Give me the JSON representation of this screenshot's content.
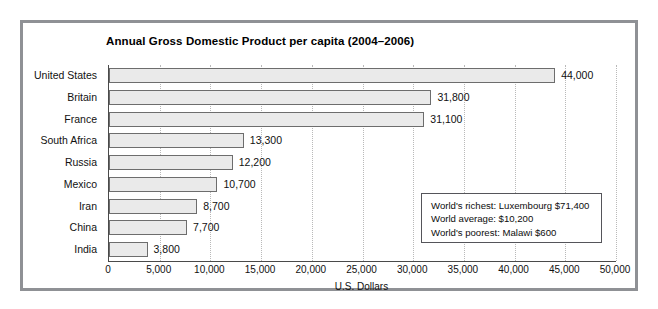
{
  "chart_data": {
    "type": "bar",
    "orientation": "horizontal",
    "title": "Annual Gross Domestic Product per capita (2004–2006)",
    "xlabel": "U.S. Dollars",
    "ylabel": "",
    "categories": [
      "United States",
      "Britain",
      "France",
      "South Africa",
      "Russia",
      "Mexico",
      "Iran",
      "China",
      "India"
    ],
    "values": [
      44000,
      31800,
      31100,
      13300,
      12200,
      10700,
      8700,
      7700,
      3800
    ],
    "value_labels": [
      "44,000",
      "31,800",
      "31,100",
      "13,300",
      "12,200",
      "10,700",
      "8,700",
      "7,700",
      "3,800"
    ],
    "xlim": [
      0,
      50000
    ],
    "xticks": [
      0,
      5000,
      10000,
      15000,
      20000,
      25000,
      30000,
      35000,
      40000,
      45000,
      50000
    ],
    "xtick_labels": [
      "0",
      "5,000",
      "10,000",
      "15,000",
      "20,000",
      "25,000",
      "30,000",
      "35,000",
      "40,000",
      "45,000",
      "50,000"
    ],
    "grid": true,
    "legend": null,
    "annotations": [
      "World's richest: Luxembourg $71,400",
      "World average: $10,200",
      "World's poorest: Malawi $600"
    ],
    "colors": {
      "bar_fill": "#eaeaea",
      "bar_edge": "#6d6d6d",
      "gridline": "#b9b9b9",
      "axis": "#4a4a4a",
      "frame": "#8f9195",
      "text": "#111111"
    }
  }
}
